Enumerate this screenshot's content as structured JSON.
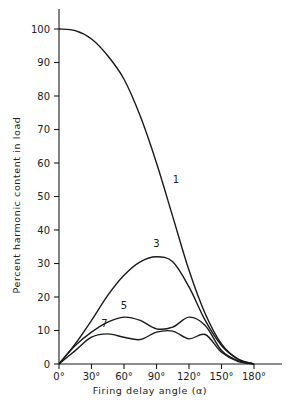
{
  "chart_data": {
    "type": "line",
    "title": "",
    "xlabel": "Firing delay angle (α)",
    "ylabel": "Percent harmonic content in load",
    "xlim": [
      0,
      180
    ],
    "ylim": [
      0,
      100
    ],
    "grid": false,
    "legend": "inline curve labels",
    "x_ticks": [
      "0°",
      "30°",
      "60°",
      "90°",
      "120°",
      "150°",
      "180°"
    ],
    "y_ticks": [
      "0",
      "10",
      "20",
      "30",
      "40",
      "50",
      "60",
      "70",
      "80",
      "90",
      "100"
    ],
    "x": [
      0,
      15,
      30,
      45,
      60,
      75,
      90,
      105,
      120,
      135,
      150,
      165,
      180
    ],
    "series": [
      {
        "name": "1",
        "label_pos": [
          108,
          54
        ],
        "values": [
          100,
          99.5,
          97,
          92,
          85,
          74,
          60,
          44,
          28,
          15,
          6,
          1.5,
          0
        ]
      },
      {
        "name": "3",
        "label_pos": [
          90,
          35
        ],
        "values": [
          0,
          6,
          13,
          20.5,
          26.5,
          30.5,
          32,
          30.5,
          23,
          13,
          5.5,
          1.5,
          0
        ]
      },
      {
        "name": "5",
        "label_pos": [
          60,
          16.5
        ],
        "values": [
          0,
          5.5,
          9.5,
          12.5,
          14,
          13,
          10.5,
          11,
          14,
          11.5,
          4,
          1,
          0
        ]
      },
      {
        "name": "7",
        "label_pos": [
          42,
          11
        ],
        "values": [
          0,
          4,
          8,
          9,
          8,
          7.3,
          9.5,
          9.8,
          7.5,
          8.8,
          3.5,
          0.8,
          0
        ]
      }
    ]
  },
  "axes": {
    "x_title": "Firing delay angle  (α)",
    "y_title": "Percent harmonic content in load"
  }
}
